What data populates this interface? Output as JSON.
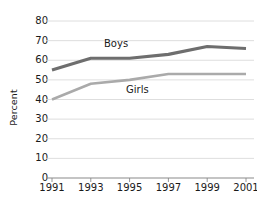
{
  "chart_data": {
    "type": "line",
    "title": "",
    "subtitle": "",
    "xlabel": "",
    "ylabel": "Percent",
    "x": [
      "1991",
      "1993",
      "1995",
      "1997",
      "1999",
      "2001"
    ],
    "categories": [
      "1991",
      "1993",
      "1995",
      "1997",
      "1999",
      "2001"
    ],
    "series": [
      {
        "name": "Boys",
        "color": "#6e6e6e",
        "values": [
          55,
          61,
          61,
          63,
          67,
          66
        ],
        "label_text": "Boys"
      },
      {
        "name": "Girls",
        "color": "#aaaaaa",
        "values": [
          40,
          48,
          50,
          53,
          53,
          53
        ],
        "label_text": "Girls"
      }
    ],
    "ylim": [
      0,
      80
    ],
    "y_ticks": [
      0,
      10,
      20,
      30,
      40,
      50,
      60,
      70,
      80
    ],
    "y_tick_labels": [
      "0",
      "10",
      "20",
      "30",
      "40",
      "50",
      "60",
      "70",
      "80"
    ],
    "x_tick_labels": [
      "1991",
      "1993",
      "1995",
      "1997",
      "1999",
      "2001"
    ],
    "grid": "horizontal",
    "grid_color": "#d6d6d6",
    "legend": "inline-series-labels",
    "legend_position": "none",
    "background": "#ffffff",
    "annotations": []
  },
  "axis": {
    "y_title": "Percent",
    "y_ticks": [
      "0",
      "10",
      "20",
      "30",
      "40",
      "50",
      "60",
      "70",
      "80"
    ],
    "x_ticks": [
      "1991",
      "1993",
      "1995",
      "1997",
      "1999",
      "2001"
    ]
  },
  "labels": {
    "boys": "Boys",
    "girls": "Girls"
  },
  "colors": {
    "boys_line": "#6e6e6e",
    "girls_line": "#aaaaaa",
    "grid": "#d6d6d6",
    "axis": "#8a8a8a",
    "text": "#1a1a1a",
    "background": "#ffffff"
  }
}
